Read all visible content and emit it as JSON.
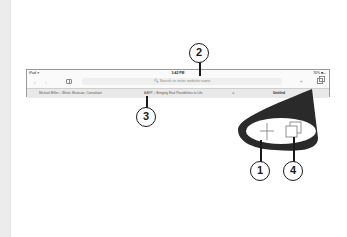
{
  "status_bar": {
    "carrier": "iPad ✈",
    "time": "3:42 PM",
    "battery": "70% ■▭"
  },
  "toolbar": {
    "back_icon": "chevron-left-icon",
    "forward_icon": "chevron-right-icon",
    "bookmarks_icon": "book-icon",
    "url_placeholder": "🔍 Search or enter website name",
    "new_tab_icon": "plus-icon",
    "tabs_icon": "tabs-icon"
  },
  "tabs": [
    {
      "label": "Michael Miller – Writer, Musician, Consultant"
    },
    {
      "label": "AARP – Bringing Real Possibilities to Life"
    },
    {
      "label": "⊗"
    },
    {
      "label": "Untitled"
    }
  ],
  "lens": {
    "plus_glyph": "+",
    "tabs_glyph": "tabs"
  },
  "callouts": {
    "c1": "1",
    "c2": "2",
    "c3": "3",
    "c4": "4"
  },
  "colors": {
    "lens": "#2a2a2a",
    "gutter": "#ececec",
    "border": "#9a9a9a"
  }
}
